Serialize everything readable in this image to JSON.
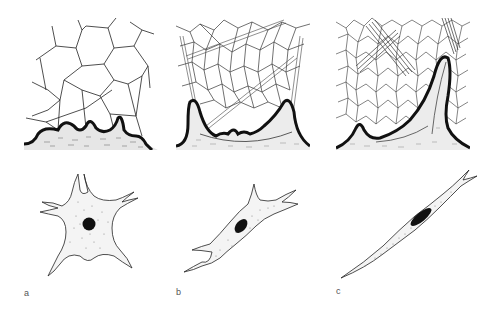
{
  "figure": {
    "panels": [
      {
        "id": "a",
        "label": "a",
        "tissue": "loose polygonal network over basal tissue",
        "cell_shape": "stellate cell with round nucleus"
      },
      {
        "id": "b",
        "label": "b",
        "tissue": "denser network with fibre bundles, deep U-shaped boundary",
        "cell_shape": "spindle-ish cell with oval nucleus"
      },
      {
        "id": "c",
        "label": "c",
        "tissue": "very dense network with fibre bundles and tall projection",
        "cell_shape": "elongated fusiform cell with elongated nucleus"
      }
    ]
  },
  "colors": {
    "ink": "#1a1a1a",
    "background": "#ffffff",
    "label": "#555555"
  }
}
